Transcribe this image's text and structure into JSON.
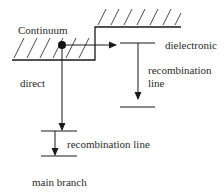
{
  "diagram": {
    "labels": {
      "continuum": "Continuum",
      "direct": "direct",
      "dielectronic": "dielectronic",
      "dr_line_1": "recombination",
      "dr_line_2": "line",
      "rr_line": "recombination line",
      "main_branch": "main branch"
    },
    "colors": {
      "line": "#1a1a1a",
      "text": "#2a2a2a",
      "background": "#ffffff"
    }
  }
}
